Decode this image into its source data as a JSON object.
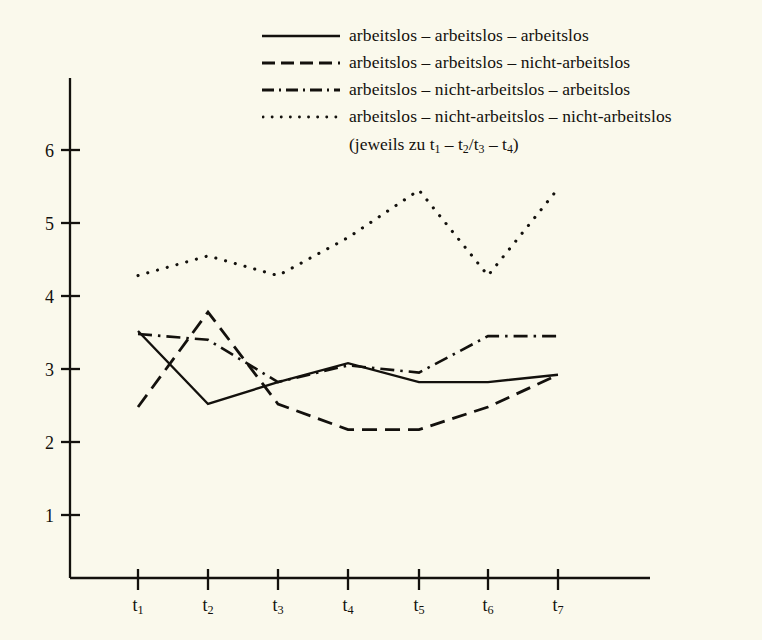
{
  "legend": {
    "items": [
      {
        "style": "solid",
        "label": "arbeitslos – arbeitslos – arbeitslos"
      },
      {
        "style": "dashed",
        "label": "arbeitslos – arbeitslos – nicht-arbeitslos"
      },
      {
        "style": "dashdot",
        "label": "arbeitslos – nicht-arbeitslos – arbeitslos"
      },
      {
        "style": "dotted",
        "label": "arbeitslos – nicht-arbeitslos – nicht-arbeitslos"
      }
    ],
    "note": "(jeweils zu t₁ – t₂/t₃ – t₄)"
  },
  "axes": {
    "y_ticks": [
      "6",
      "5",
      "4",
      "3",
      "2",
      "1"
    ],
    "x_ticks": [
      "t₁",
      "t₂",
      "t₃",
      "t₄",
      "t₅",
      "t₆",
      "t₇"
    ]
  },
  "colors": {
    "background": "#faf9ec",
    "ink": "#13110d"
  },
  "chart_data": {
    "type": "line",
    "title": "",
    "xlabel": "",
    "ylabel": "",
    "x": [
      "t₁",
      "t₂",
      "t₃",
      "t₄",
      "t₅",
      "t₆",
      "t₇"
    ],
    "ylim": [
      0,
      6.4
    ],
    "xlim": [
      0,
      8
    ],
    "grid": false,
    "legend_position": "top",
    "series": [
      {
        "name": "arbeitslos – arbeitslos – arbeitslos",
        "style": "solid",
        "values": [
          3.52,
          2.52,
          2.82,
          3.08,
          2.82,
          2.82,
          2.92
        ]
      },
      {
        "name": "arbeitslos – arbeitslos – nicht-arbeitslos",
        "style": "dashed",
        "values": [
          2.48,
          3.78,
          2.52,
          2.17,
          2.17,
          2.48,
          2.92
        ]
      },
      {
        "name": "arbeitslos – nicht-arbeitslos – arbeitslos",
        "style": "dashdot",
        "values": [
          3.48,
          3.4,
          2.82,
          3.05,
          2.95,
          3.45,
          3.45
        ]
      },
      {
        "name": "arbeitslos – nicht-arbeitslos – nicht-arbeitslos",
        "style": "dotted",
        "values": [
          4.28,
          4.55,
          4.28,
          4.8,
          5.45,
          4.28,
          5.47
        ]
      }
    ]
  }
}
